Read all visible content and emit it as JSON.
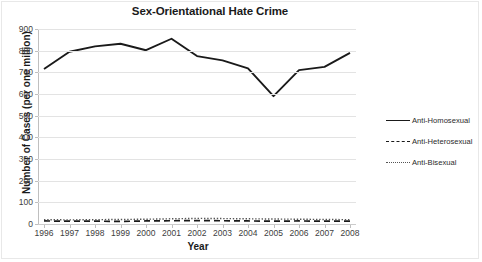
{
  "chart_data": {
    "type": "line",
    "title": "Sex-Orientational Hate Crime",
    "xlabel": "Year",
    "ylabel": "Number of Cases (per one million)",
    "categories": [
      "1996",
      "1997",
      "1998",
      "1999",
      "2000",
      "2001",
      "2002",
      "2003",
      "2004",
      "2005",
      "2006",
      "2007",
      "2008"
    ],
    "x": [
      1996,
      1997,
      1998,
      1999,
      2000,
      2001,
      2002,
      2003,
      2004,
      2005,
      2006,
      2007,
      2008
    ],
    "ylim": [
      0,
      900
    ],
    "xlim": [
      1996,
      2008
    ],
    "yticks": [
      0,
      100,
      200,
      300,
      400,
      500,
      600,
      700,
      800,
      900
    ],
    "ytick_labels": [
      "0",
      "100",
      "200",
      "300",
      "400",
      "500",
      "600",
      "700",
      "800",
      "900"
    ],
    "grid": true,
    "legend_position": "right",
    "series": [
      {
        "name": "Anti-Homosexual",
        "style": "solid",
        "color": "#1a1a1a",
        "values": [
          715,
          795,
          820,
          832,
          802,
          855,
          775,
          755,
          718,
          590,
          710,
          725,
          790
        ]
      },
      {
        "name": "Anti-Heterosexual",
        "style": "dashed",
        "color": "#1a1a1a",
        "values": [
          14,
          13,
          13,
          12,
          14,
          15,
          16,
          15,
          14,
          13,
          14,
          13,
          13
        ]
      },
      {
        "name": "Anti-Bisexual",
        "style": "dotted",
        "color": "#555555",
        "values": [
          20,
          19,
          20,
          21,
          22,
          24,
          26,
          25,
          24,
          23,
          22,
          21,
          20
        ]
      }
    ]
  },
  "legend": {
    "items": [
      {
        "label": "Anti-Homosexual",
        "swatch": "solid-line-swatch"
      },
      {
        "label": "Anti-Heterosexual",
        "swatch": "dashed-line-swatch"
      },
      {
        "label": "Anti-Bisexual",
        "swatch": "dotted-line-swatch"
      }
    ]
  }
}
